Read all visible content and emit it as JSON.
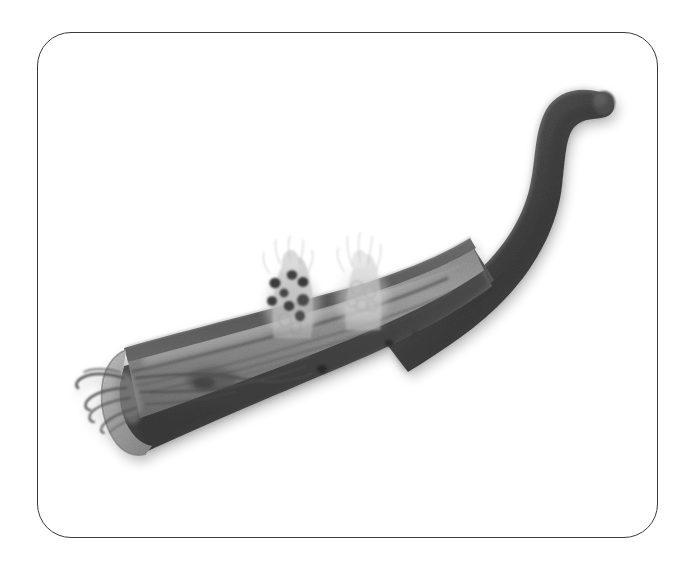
{
  "document": {
    "kind": "scientific-illustration",
    "title": "Grayscale anatomical illustration of a curved tubular organ",
    "medium": "pencil / graphite shaded drawing",
    "palette": "grayscale",
    "background_color": "#ffffff"
  },
  "frame": {
    "name": "rounded rectangle border",
    "stroke_color": "#3a3a3a",
    "stroke_width_px": 1.6,
    "corner_radius_px": 34,
    "left_px": 37,
    "top_px": 32,
    "width_px": 621,
    "height_px": 506
  },
  "illustration": {
    "subject": "curved tubular organ segment, opened longitudinally at the distal end",
    "orientation": "runs from lower-left cut end, sweeping up and right in an S-curve to a rounded free tip at upper right",
    "colors": {
      "tube_outer_dark": "#5e5e5e",
      "tube_outer_darkest": "#3d3d3d",
      "tube_shadow": "#2e2e2e",
      "lumen_inner_mid": "#7a7a7a",
      "lumen_inner_light": "#9d9d9d",
      "cut_face_light": "#b4b4b4",
      "highlight_rim": "#d4d4d4",
      "growth_ghost": "#c9c9c9",
      "growth_spot_dark": "#4a4a4a",
      "strand_dark": "#555555"
    },
    "parts": [
      {
        "id": "distal-tube",
        "name": "intact tubular segment",
        "description": "smooth dark S-curved tube sweeping from mid-right upward and curving right to a blunt rounded tip",
        "tip_point": {
          "x": 607,
          "y": 95
        }
      },
      {
        "id": "opened-tube",
        "name": "longitudinally opened segment",
        "description": "the lower-left portion of the tube split open, showing pale inner mucosal surface with longitudinal folds"
      },
      {
        "id": "cut-face",
        "name": "cut cross-section end",
        "description": "flat beveled cross-section at the lower-left terminus of the tube",
        "position": {
          "x": 126,
          "y": 390
        }
      },
      {
        "id": "inner-folds",
        "name": "longitudinal mucosal folds",
        "description": "wavy darker lines running along the exposed inner surface"
      },
      {
        "id": "strands",
        "name": "fibrous strands at cut end",
        "description": "four to five thin thread-like filaments trailing out to the left from the cut face",
        "count": 5
      },
      {
        "id": "growth-left",
        "name": "spotted translucent growth",
        "description": "faint ghosted cluster rising from the upper wall of the opened segment, containing a group of dark rounded spots",
        "position": {
          "x": 290,
          "y": 300
        },
        "spot_count": 8
      },
      {
        "id": "growth-right",
        "name": "pale translucent growth",
        "description": "second fainter ghosted cluster to the right, no dark spots, lighter and more diffuse",
        "position": {
          "x": 362,
          "y": 295
        }
      },
      {
        "id": "surface-pores",
        "name": "dark pores on inner surface",
        "description": "three small dark round openings scattered on the exposed inner surface",
        "count": 3
      }
    ],
    "labels": [],
    "annotations": []
  }
}
